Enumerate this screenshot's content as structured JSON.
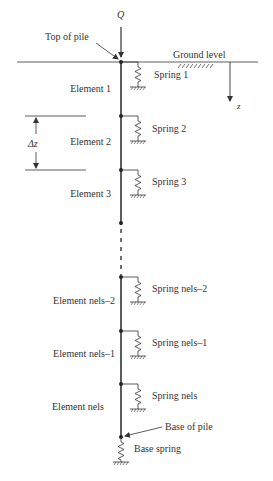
{
  "diagram": {
    "load_label": "Q",
    "top_of_pile_label": "Top of pile",
    "ground_level_label": "Ground level",
    "depth_axis_label": "z",
    "element_length_label": "Δz",
    "base_of_pile_label": "Base of pile",
    "base_spring_label": "Base spring",
    "elements": [
      {
        "label": "Element 1",
        "spring": "Spring 1"
      },
      {
        "label": "Element 2",
        "spring": "Spring 2"
      },
      {
        "label": "Element 3",
        "spring": "Spring 3"
      },
      {
        "label": "Element nels–2",
        "spring": "Spring nels–2"
      },
      {
        "label": "Element nels–1",
        "spring": "Spring nels–1"
      },
      {
        "label": "Element nels",
        "spring": "Spring nels"
      }
    ],
    "colors": {
      "line": "#333333",
      "background": "#ffffff"
    }
  }
}
